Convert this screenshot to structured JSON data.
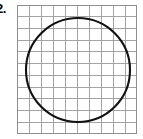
{
  "figure": {
    "label": "2.",
    "caption": "Circle inscribed in a square grid",
    "background_color": "#ffffff"
  },
  "grid": {
    "name": "square-grid",
    "x": 17,
    "y": 5,
    "width": 120,
    "height": 129,
    "columns": 10,
    "rows": 11,
    "cell_width": 12,
    "cell_height": 11.7,
    "line_color": "#9a9a9a",
    "line_width": 0.9,
    "border_color": "#8e8e8e",
    "border_width": 1
  },
  "shape": {
    "name": "circle",
    "type": "circle",
    "center_x": 61,
    "center_y": 65,
    "radius": 52,
    "stroke_color": "#111111",
    "stroke_width": 2.1,
    "fill": "none",
    "diameter_cells": 8.7
  }
}
